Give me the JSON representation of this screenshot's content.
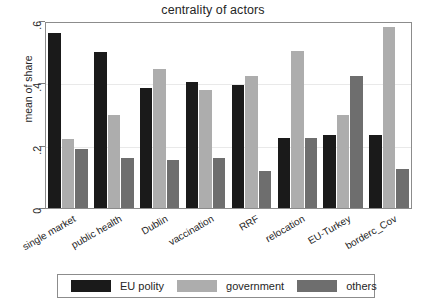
{
  "chart_data": {
    "type": "bar",
    "title": "centrality of actors",
    "xlabel": "",
    "ylabel": "mean of share",
    "categories": [
      "single market",
      "public health",
      "Dublin",
      "vaccination",
      "RRF",
      "relocation",
      "EU-Turkey",
      "borderc_Cov"
    ],
    "series": [
      {
        "name": "EU polity",
        "color": "#1a1a1a",
        "values": [
          0.56,
          0.5,
          0.385,
          0.405,
          0.395,
          0.225,
          0.235,
          0.235
        ]
      },
      {
        "name": "government",
        "color": "#adadad",
        "values": [
          0.22,
          0.3,
          0.445,
          0.38,
          0.425,
          0.505,
          0.3,
          0.58
        ]
      },
      {
        "name": "others",
        "color": "#6e6e6e",
        "values": [
          0.19,
          0.16,
          0.155,
          0.16,
          0.12,
          0.225,
          0.425,
          0.125
        ]
      }
    ],
    "ylim": [
      0,
      0.6
    ],
    "yticks": [
      0,
      0.2,
      0.4,
      0.6
    ],
    "ytick_labels": [
      "0",
      ".2",
      ".4",
      ".6"
    ],
    "grid": true,
    "legend_position": "bottom"
  },
  "legend": {
    "entries": [
      {
        "label": "EU polity"
      },
      {
        "label": "government"
      },
      {
        "label": "others"
      }
    ]
  }
}
